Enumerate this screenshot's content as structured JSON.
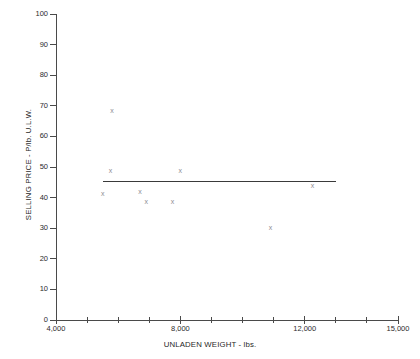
{
  "chart_data": {
    "type": "scatter",
    "title": "",
    "xlabel": "UNLADEN WEIGHT - lbs.",
    "ylabel": "SELLING PRICE - P/lb. U.L.W.",
    "xlim": [
      4000,
      15000
    ],
    "ylim": [
      0,
      100
    ],
    "grid": false,
    "legend": null,
    "marker": "x",
    "x_ticks": [
      4000,
      5000,
      6000,
      7000,
      8000,
      9000,
      10000,
      11000,
      12000,
      13000,
      14000,
      15000
    ],
    "x_tick_labels": [
      "4,000",
      "",
      "",
      "",
      "8,000",
      "",
      "",
      "",
      "12,000",
      "",
      "",
      "15,000"
    ],
    "x_labeled_ticks": [
      {
        "value": 4000,
        "label": "4,000"
      },
      {
        "value": 8000,
        "label": "8,000"
      },
      {
        "value": 12000,
        "label": "12,000"
      },
      {
        "value": 15000,
        "label": "15,000"
      }
    ],
    "y_ticks": [
      0,
      10,
      20,
      30,
      40,
      50,
      60,
      70,
      80,
      90,
      100
    ],
    "y_tick_labels": [
      "0",
      "10",
      "20",
      "30",
      "40",
      "50",
      "60",
      "70",
      "80",
      "90",
      "100"
    ],
    "points": [
      {
        "x": 5800,
        "y": 68.5
      },
      {
        "x": 5750,
        "y": 49.0
      },
      {
        "x": 5500,
        "y": 41.5
      },
      {
        "x": 6700,
        "y": 42.0
      },
      {
        "x": 6900,
        "y": 38.8
      },
      {
        "x": 7750,
        "y": 38.8
      },
      {
        "x": 8000,
        "y": 49.0
      },
      {
        "x": 10900,
        "y": 30.3
      },
      {
        "x": 12250,
        "y": 44.0
      }
    ],
    "series_name": "Vehicles",
    "trend_line": {
      "type": "horizontal",
      "y": 45.5,
      "x_start": 5500,
      "x_end": 13000,
      "color": "#3a3a3a"
    }
  },
  "colors": {
    "axis": "#4a4a4a",
    "text": "#1f1f1f",
    "marker": "#8d8d93",
    "trend": "#3a3a3a",
    "background": "#ffffff"
  }
}
